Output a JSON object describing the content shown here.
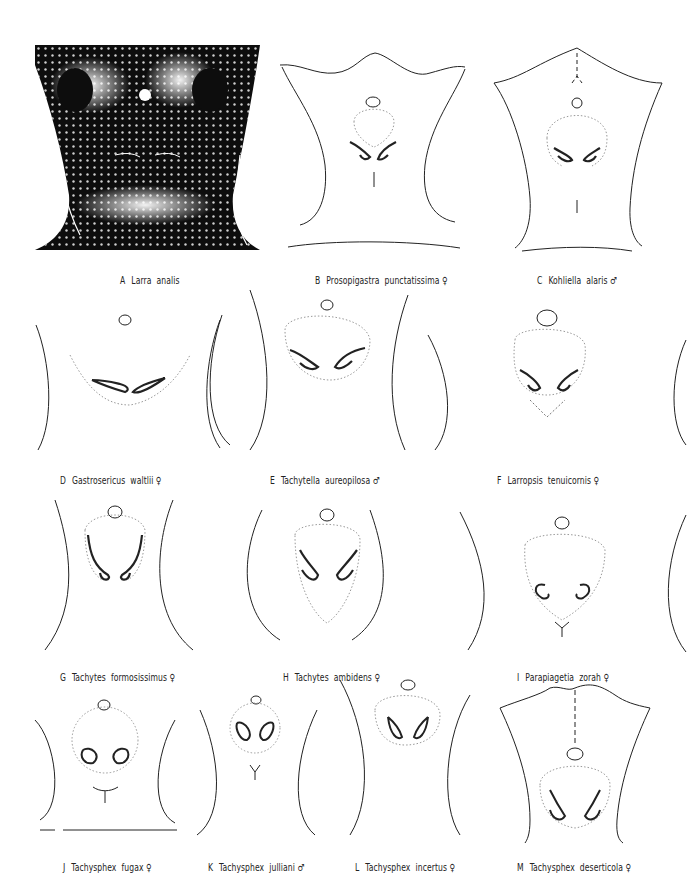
{
  "plate": {
    "figures": [
      {
        "letter": "A",
        "taxon": "Larra  analis",
        "sex": ""
      },
      {
        "letter": "B",
        "taxon": "Prosopigastra  punctatissima",
        "sex": "♀"
      },
      {
        "letter": "C",
        "taxon": "Kohliella  alaris",
        "sex": "♂"
      },
      {
        "letter": "D",
        "taxon": "Gastrosericus  waltlii",
        "sex": "♀"
      },
      {
        "letter": "E",
        "taxon": "Tachytella  aureopilosa",
        "sex": "♂"
      },
      {
        "letter": "F",
        "taxon": "Larropsis  tenuicornis",
        "sex": "♀"
      },
      {
        "letter": "G",
        "taxon": "Tachytes  formosissimus",
        "sex": "♀"
      },
      {
        "letter": "H",
        "taxon": "Tachytes  ambidens",
        "sex": "♀"
      },
      {
        "letter": "I",
        "taxon": "Parapiagetia  zorah",
        "sex": "♀"
      },
      {
        "letter": "J",
        "taxon": "Tachysphex  fugax",
        "sex": "♀"
      },
      {
        "letter": "K",
        "taxon": "Tachysphex  julliani",
        "sex": "♂"
      },
      {
        "letter": "L",
        "taxon": "Tachysphex  incertus",
        "sex": "♀"
      },
      {
        "letter": "M",
        "taxon": "Tachysphex  deserticola",
        "sex": "♀"
      }
    ],
    "colors": {
      "ink": "#222222",
      "dotted": "#9a9a9a",
      "background": "#ffffff"
    }
  }
}
